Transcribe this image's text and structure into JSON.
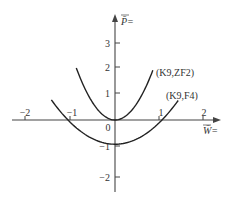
{
  "chart_data": {
    "type": "line",
    "title": "",
    "xlabel": "W̄=",
    "ylabel": "P̄=",
    "xlim": [
      -2.3,
      2.35
    ],
    "ylim": [
      -2.8,
      4.3
    ],
    "x_ticks": [
      -2,
      -1,
      0,
      1,
      2
    ],
    "x_tick_labels": [
      "−2",
      "−1",
      "0",
      "1",
      "2"
    ],
    "y_ticks": [
      -2,
      -1,
      1,
      2,
      3
    ],
    "y_tick_labels": [
      "−2",
      "−1",
      "1",
      "2",
      "3"
    ],
    "grid": false,
    "legend": "inline labels at right ends of curves",
    "series": [
      {
        "name": "(K9,ZF2)",
        "description": "narrow upward parabola, vertex at origin",
        "equation": "y = 2.7 x^2",
        "x": [
          -0.87,
          -0.7,
          -0.5,
          -0.3,
          -0.1,
          0,
          0.1,
          0.3,
          0.5,
          0.7,
          0.85
        ],
        "y": [
          2.04,
          1.32,
          0.68,
          0.24,
          0.03,
          0,
          0.03,
          0.24,
          0.68,
          1.32,
          1.95
        ]
      },
      {
        "name": "(K9,F4)",
        "description": "wide upward parabola, vertex near (0,-0.95)",
        "equation": "y = 0.85 x^2 - 0.95",
        "x": [
          -1.43,
          -1.2,
          -1.06,
          -0.8,
          -0.5,
          0,
          0.5,
          0.8,
          1.06,
          1.2,
          1.42
        ],
        "y": [
          0.79,
          0.27,
          0.0,
          -0.41,
          -0.74,
          -0.95,
          -0.74,
          -0.41,
          0.0,
          0.27,
          0.76
        ]
      }
    ]
  },
  "labels": {
    "x_axis": "W̄=",
    "y_axis": "P̄=",
    "origin": "0",
    "curve1": "(K9,ZF2)",
    "curve2": "(K9,F4)",
    "xt_m2": "−2",
    "xt_m1": "−1",
    "xt_p1": "1",
    "xt_p2": "2",
    "yt_p3": "3",
    "yt_p2": "2",
    "yt_p1": "1",
    "yt_m1": "−1",
    "yt_m2": "−2"
  }
}
